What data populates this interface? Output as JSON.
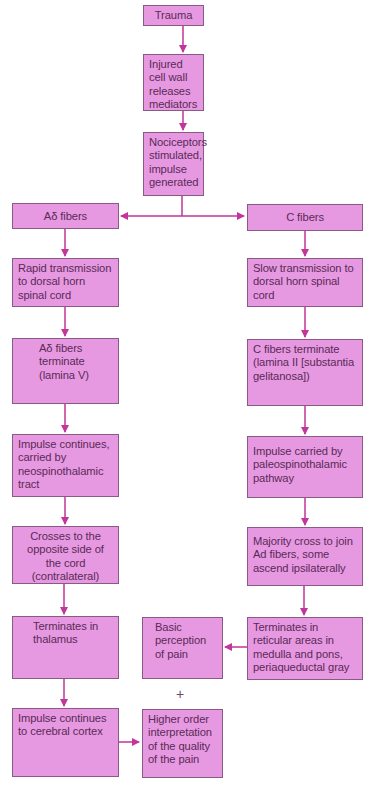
{
  "diagram": {
    "title": "",
    "colors": {
      "box_fill": "#e699e0",
      "box_border": "#8a5a86",
      "text": "#5a2a58",
      "arrow": "#c2359a"
    },
    "nodes": {
      "trauma": "Trauma",
      "injured_cell": "Injured cell wall releases mediators",
      "nociceptors": "Nociceptors stimulated, impulse generated",
      "a_delta_fibers": "Aδ fibers",
      "c_fibers": "C fibers",
      "rapid_transmission": "Rapid transmission to dorsal horn spinal cord",
      "slow_transmission": "Slow transmission to dorsal horn spinal cord",
      "a_delta_terminate": "Aδ fibers terminate (lamina V)",
      "c_terminate": "C fibers terminate (lamina II [substantia gelitanosa])",
      "impulse_continues_neo": "Impulse continues, carried by neospinothalamic tract",
      "impulse_carried_paleo": "Impulse carried by paleospinothalamic pathway",
      "crosses_opposite": "Crosses to the opposite side of the cord (contralateral)",
      "majority_cross": "Majority cross to join Ad fibers, some ascend ipsilaterally",
      "terminates_thalamus": "Terminates in thalamus",
      "basic_perception": "Basic perception of pain",
      "terminates_reticular": "Terminates in reticular areas in medulla and pons, periaqueductal gray",
      "impulse_cortex": "Impulse continues to cerebral cortex",
      "higher_order": "Higher order interpretation of the quality of the pain"
    },
    "plus_sign": "+"
  }
}
